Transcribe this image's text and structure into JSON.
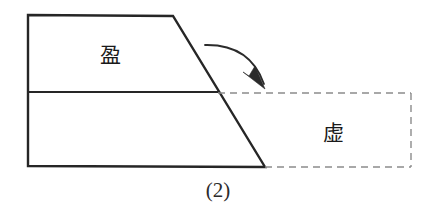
{
  "figure": {
    "caption": "(2)",
    "background_color": "#ffffff",
    "solid_stroke_color": "#262626",
    "dashed_stroke_color": "#8c8c8c",
    "arrow_color": "#2b2b2b",
    "solid_stroke_width": 2.4,
    "dashed_stroke_width": 1.4,
    "solid_region": {
      "name": "ying-trapezoid",
      "label": "盈",
      "label_x": 110,
      "label_y": 55,
      "points": "28,15 173,16 265,167 28,166"
    },
    "divider": {
      "name": "horizontal-divider",
      "x1": 28,
      "y1": 92,
      "x2": 218,
      "y2": 92
    },
    "dashed_region": {
      "name": "xu-rectangle",
      "label": "虚",
      "label_x": 333,
      "label_y": 133,
      "points": "218,93 411,93 411,167 265,167",
      "top_edge": {
        "x1": 218,
        "y1": 93,
        "x2": 411,
        "y2": 93
      },
      "right_edge": {
        "x1": 411,
        "y1": 93,
        "x2": 411,
        "y2": 167
      },
      "bottom_edge": {
        "x1": 265,
        "y1": 167,
        "x2": 411,
        "y2": 167
      },
      "dash_pattern": "7 5"
    },
    "arrow": {
      "name": "rotation-arrow",
      "path": "M 205 45 Q 250 44 264 84",
      "head_tip_x": 265,
      "head_tip_y": 89,
      "head_points": "265,89 255,66 249,76 243,72"
    },
    "caption_x": 218,
    "caption_y": 190
  }
}
